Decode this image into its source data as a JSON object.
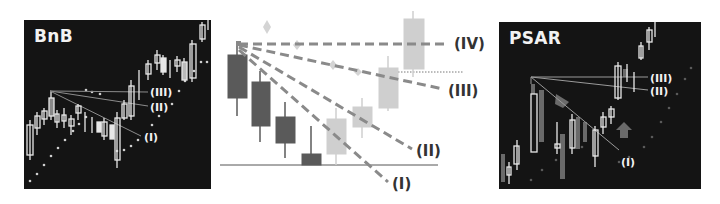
{
  "left_panel": {
    "title": "BnB",
    "line_labels": [
      "(III)",
      "(II)",
      "(I)"
    ]
  },
  "middle_diagram": {
    "line_labels": [
      "(IV)",
      "(III)",
      "(II)",
      "(I)"
    ],
    "colors": {
      "bearish_candle": "#5a5a5a",
      "bullish_candle": "#cfcfcf",
      "dashed_line": "#8a8a8a",
      "psar_dot": "#d4d4d4",
      "baseline": "#555555"
    }
  },
  "right_panel": {
    "title": "PSAR",
    "line_labels": [
      "(III)",
      "(II)",
      "(I)"
    ]
  },
  "colors": {
    "panel_bg": "#141414",
    "panel_text": "#f2f2f2",
    "page_bg": "#ffffff"
  }
}
